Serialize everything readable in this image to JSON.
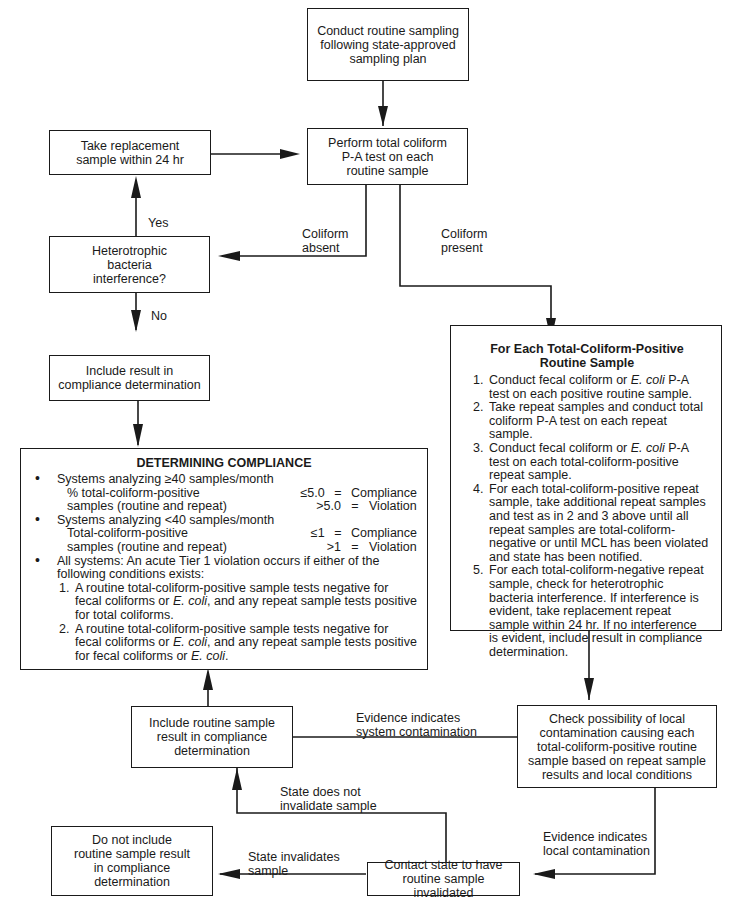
{
  "boxes": {
    "routine_sampling": "Conduct routine sampling\nfollowing state-approved\nsampling plan",
    "perform_test": "Perform total coliform\nP-A test on each\nroutine sample",
    "replacement": "Take replacement\nsample within 24 hr",
    "heterotrophic": "Heterotrophic\nbacteria\ninterference?",
    "include_result": "Include result in\ncompliance determination",
    "include_routine": "Include routine sample\nresult in compliance\ndetermination",
    "check_local": "Check possibility of local\ncontamination causing each\ntotal-coliform-positive routine\nsample based on repeat sample\nresults and local conditions",
    "contact_state": "Contact state to have\nroutine sample invalidated",
    "do_not_include": "Do not include\nroutine sample result\nin compliance\ndetermination"
  },
  "edge_labels": {
    "yes": "Yes",
    "no": "No",
    "coliform_absent": "Coliform\nabsent",
    "coliform_present": "Coliform\npresent",
    "system_contamination": "Evidence indicates\nsystem contamination",
    "local_contamination": "Evidence indicates\nlocal contamination",
    "state_not_invalidate": "State does not\ninvalidate sample",
    "state_invalidates": "State invalidates\nsample"
  },
  "repeat_panel": {
    "title_line1": "For Each Total-Coliform-Positive",
    "title_line2": "Routine Sample",
    "steps": [
      {
        "pre": "Conduct fecal coliform or ",
        "em": "E. coli",
        "post": " P-A test on each positive routine sample."
      },
      {
        "pre": "Take repeat samples and conduct total coliform P-A test on each repeat sample.",
        "em": "",
        "post": ""
      },
      {
        "pre": "Conduct fecal coliform or ",
        "em": "E. coli",
        "post": " P-A test on each total-coliform-positive repeat sample."
      },
      {
        "pre": "For each total-coliform-positive repeat sample, take additional repeat samples and test as in 2 and 3 above until all repeat samples are total-coliform-negative or until MCL has been violated and state has been notified.",
        "em": "",
        "post": ""
      },
      {
        "pre": "For each total-coliform-negative repeat sample, check for heterotrophic bacteria interference. If interference is evident, take replacement repeat sample within 24 hr. If no interference is evident, include result in compliance determination.",
        "em": "",
        "post": ""
      }
    ]
  },
  "compliance_panel": {
    "title": "DETERMINING COMPLIANCE",
    "ge40": {
      "heading": "Systems analyzing ≥40 samples/month",
      "rows": [
        {
          "text": "% total-coliform-positive",
          "value": "≤5.0",
          "eq": "=",
          "result": "Compliance"
        },
        {
          "text": "samples (routine and repeat)",
          "value": ">5.0",
          "eq": "=",
          "result": "Violation"
        }
      ]
    },
    "lt40": {
      "heading": "Systems analyzing <40 samples/month",
      "rows": [
        {
          "text": "Total-coliform-positive",
          "value": "≤1",
          "eq": "=",
          "result": "Compliance"
        },
        {
          "text": "samples (routine and repeat)",
          "value": ">1",
          "eq": "=",
          "result": "Violation"
        }
      ]
    },
    "all_systems": "All systems: An acute Tier 1 violation occurs if either of the following conditions exists:",
    "conditions": [
      {
        "a": "A routine total-coliform-positive sample tests negative for fecal coliforms or ",
        "em": "E. coli",
        "b": ", and any repeat sample tests positive for total coliforms.",
        "em2": "",
        "c": ""
      },
      {
        "a": "A routine total-coliform-positive sample tests negative for fecal coliforms or ",
        "em": "E. coli",
        "b": ", and any repeat sample tests positive for fecal coliforms or ",
        "em2": "E. coli",
        "c": "."
      }
    ]
  }
}
